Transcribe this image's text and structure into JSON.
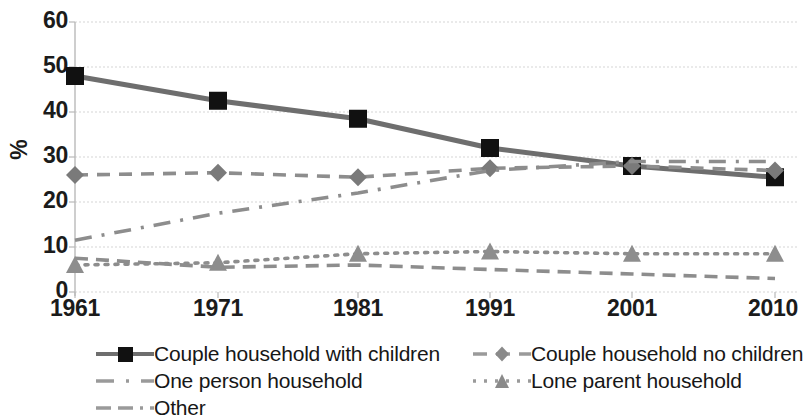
{
  "chart_data": {
    "type": "line",
    "title": "",
    "subtitle": "",
    "xlabel": "",
    "ylabel": "%",
    "categories": [
      "1961",
      "1971",
      "1981",
      "1991",
      "2001",
      "2010"
    ],
    "x": [
      1961,
      1971,
      1981,
      1991,
      2001,
      2010
    ],
    "ylim": [
      0,
      60
    ],
    "yticks": [
      0,
      10,
      20,
      30,
      40,
      50,
      60
    ],
    "grid": true,
    "legend_position": "bottom",
    "series": [
      {
        "name": "Couple household with children",
        "values": [
          48,
          42.5,
          38.5,
          32,
          28,
          25.5
        ],
        "marker": "square",
        "line_style": "solid",
        "color": "#6e6e6e",
        "marker_color": "#111111"
      },
      {
        "name": "Couple household no children",
        "values": [
          26,
          26.5,
          25.5,
          27.5,
          28,
          27
        ],
        "marker": "diamond",
        "line_style": "dashed",
        "color": "#8d8d8d",
        "marker_color": "#7a7a7a"
      },
      {
        "name": "One person household",
        "values": [
          11.5,
          17.5,
          22,
          27,
          29,
          29
        ],
        "marker": "none",
        "line_style": "dash-dot",
        "color": "#8d8d8d",
        "marker_color": "#8d8d8d"
      },
      {
        "name": "Lone parent household",
        "values": [
          6,
          6.5,
          8.5,
          9,
          8.5,
          8.5
        ],
        "marker": "triangle",
        "line_style": "dotted",
        "color": "#8d8d8d",
        "marker_color": "#8d8d8d"
      },
      {
        "name": "Other",
        "values": [
          7.5,
          5.5,
          6,
          5,
          4,
          3
        ],
        "marker": "none",
        "line_style": "long-dash",
        "color": "#8d8d8d",
        "marker_color": "#8d8d8d"
      }
    ]
  },
  "axes": {
    "y_ticks": [
      "60",
      "50",
      "40",
      "30",
      "20",
      "10",
      "0"
    ],
    "y_title": "%",
    "x_ticks": [
      "1961",
      "1971",
      "1981",
      "1991",
      "2001",
      "2010"
    ]
  },
  "legend": {
    "items": [
      {
        "label": "Couple household with children",
        "key": "solid-square-key"
      },
      {
        "label": "Couple household no children",
        "key": "dashed-diamond-key"
      },
      {
        "label": "One person household",
        "key": "dashdot-key"
      },
      {
        "label": "Lone parent household",
        "key": "dotted-triangle-key"
      },
      {
        "label": "Other",
        "key": "longdash-key"
      }
    ]
  }
}
